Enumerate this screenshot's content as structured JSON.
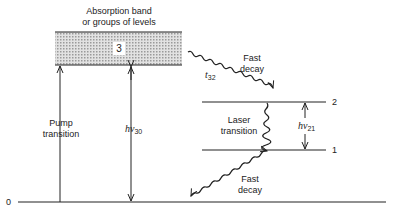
{
  "diagram": {
    "type": "energy-level-diagram",
    "band": {
      "title_line1": "Absorption band",
      "title_line2": "or groups of levels",
      "label": "3"
    },
    "levels": [
      {
        "id": "0",
        "label": "0"
      },
      {
        "id": "1",
        "label": "1"
      },
      {
        "id": "2",
        "label": "2"
      },
      {
        "id": "3",
        "label": "3"
      }
    ],
    "transitions": {
      "pump": {
        "line1": "Pump",
        "line2": "transition"
      },
      "hv30": {
        "main": "hν",
        "sub": "30"
      },
      "fast_decay_top": {
        "line1": "Fast",
        "line2": "decay",
        "time_main": "t",
        "time_sub": "32"
      },
      "laser": {
        "line1": "Laser",
        "line2": "transition"
      },
      "hv21": {
        "main": "hν",
        "sub": "21"
      },
      "fast_decay_bottom": {
        "line1": "Fast",
        "line2": "decay"
      }
    },
    "colors": {
      "line": "#222222",
      "band_fill": "#c8c8c8"
    }
  }
}
